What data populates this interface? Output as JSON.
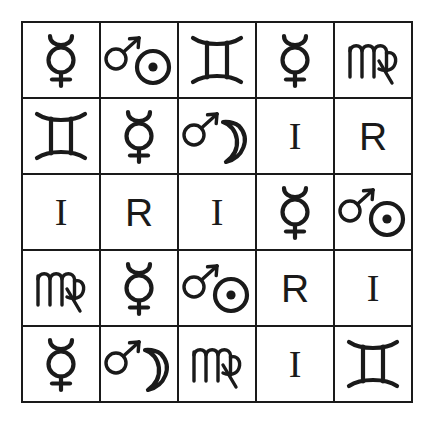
{
  "page": {
    "background_color": "#ffffff",
    "line_color": "#1a1a1a",
    "rows": 5,
    "columns": 5
  },
  "legend": {
    "mercury": "mercury-symbol",
    "mars_sun": "mars-sun-symbol",
    "mars_moon": "mars-moon-symbol",
    "gemini": "gemini-symbol",
    "virgo": "virgo-symbol",
    "letter_i": "I",
    "letter_r": "R"
  },
  "cells": [
    {
      "row": 1,
      "col": 1,
      "type": "mercury",
      "name": "Mercury",
      "glyph": "☿",
      "label": ""
    },
    {
      "row": 1,
      "col": 2,
      "type": "mars_sun",
      "name": "Mars Sun",
      "glyph": "♂☉",
      "label": ""
    },
    {
      "row": 1,
      "col": 3,
      "type": "gemini",
      "name": "Gemini",
      "glyph": "♊",
      "label": ""
    },
    {
      "row": 1,
      "col": 4,
      "type": "mercury",
      "name": "Mercury",
      "glyph": "☿",
      "label": ""
    },
    {
      "row": 1,
      "col": 5,
      "type": "virgo",
      "name": "Virgo",
      "glyph": "♍",
      "label": ""
    },
    {
      "row": 2,
      "col": 1,
      "type": "gemini",
      "name": "Gemini",
      "glyph": "♊",
      "label": ""
    },
    {
      "row": 2,
      "col": 2,
      "type": "mercury",
      "name": "Mercury",
      "glyph": "☿",
      "label": ""
    },
    {
      "row": 2,
      "col": 3,
      "type": "mars_moon",
      "name": "Mars Moon",
      "glyph": "♂☽",
      "label": ""
    },
    {
      "row": 2,
      "col": 4,
      "type": "letter",
      "name": "Letter I",
      "glyph": "",
      "label": "I"
    },
    {
      "row": 2,
      "col": 5,
      "type": "letter",
      "name": "Letter R",
      "glyph": "",
      "label": "R"
    },
    {
      "row": 3,
      "col": 1,
      "type": "letter",
      "name": "Letter I",
      "glyph": "",
      "label": "I"
    },
    {
      "row": 3,
      "col": 2,
      "type": "letter",
      "name": "Letter R",
      "glyph": "",
      "label": "R"
    },
    {
      "row": 3,
      "col": 3,
      "type": "letter",
      "name": "Letter I",
      "glyph": "",
      "label": "I"
    },
    {
      "row": 3,
      "col": 4,
      "type": "mercury",
      "name": "Mercury",
      "glyph": "☿",
      "label": ""
    },
    {
      "row": 3,
      "col": 5,
      "type": "mars_sun",
      "name": "Mars Sun",
      "glyph": "♂☉",
      "label": ""
    },
    {
      "row": 4,
      "col": 1,
      "type": "virgo",
      "name": "Virgo",
      "glyph": "♍",
      "label": ""
    },
    {
      "row": 4,
      "col": 2,
      "type": "mercury",
      "name": "Mercury",
      "glyph": "☿",
      "label": ""
    },
    {
      "row": 4,
      "col": 3,
      "type": "mars_sun",
      "name": "Mars Sun",
      "glyph": "♂☉",
      "label": ""
    },
    {
      "row": 4,
      "col": 4,
      "type": "letter",
      "name": "Letter R",
      "glyph": "",
      "label": "R"
    },
    {
      "row": 4,
      "col": 5,
      "type": "letter",
      "name": "Letter I",
      "glyph": "",
      "label": "I"
    },
    {
      "row": 5,
      "col": 1,
      "type": "mercury",
      "name": "Mercury",
      "glyph": "☿",
      "label": ""
    },
    {
      "row": 5,
      "col": 2,
      "type": "mars_moon",
      "name": "Mars Moon",
      "glyph": "♂☽",
      "label": ""
    },
    {
      "row": 5,
      "col": 3,
      "type": "virgo",
      "name": "Virgo",
      "glyph": "♍",
      "label": ""
    },
    {
      "row": 5,
      "col": 4,
      "type": "letter",
      "name": "Letter I",
      "glyph": "",
      "label": "I"
    },
    {
      "row": 5,
      "col": 5,
      "type": "gemini",
      "name": "Gemini",
      "glyph": "♊",
      "label": ""
    }
  ]
}
